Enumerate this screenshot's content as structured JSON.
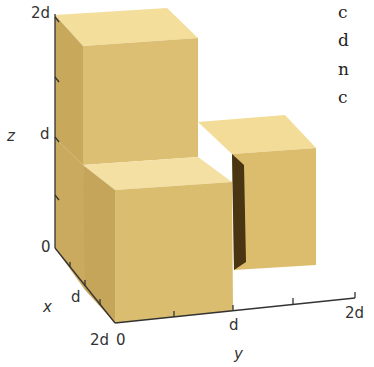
{
  "figure": {
    "colors": {
      "top_face": "#f3dd99",
      "front_face": "#dcbf72",
      "side_face": "#c8a95c",
      "shadow": "#4a3512",
      "axis": "#333333",
      "background": "#ffffff"
    },
    "axes": {
      "z": {
        "name": "z",
        "ticks": [
          "0",
          "d",
          "2d"
        ]
      },
      "x": {
        "name": "x",
        "ticks": [
          "0",
          "d",
          "2d"
        ]
      },
      "y": {
        "name": "y",
        "ticks": [
          "0",
          "d",
          "2d"
        ]
      }
    },
    "tick_labels": {
      "z_2d": "2d",
      "z_d": "d",
      "z_0": "0",
      "x_d": "d",
      "x_2d": "2d",
      "y_0": "0",
      "y_d": "d",
      "y_2d": "2d"
    },
    "cubes": [
      {
        "name": "upper-cube",
        "x": "0..d",
        "y": "0..d",
        "z": "d..2d"
      },
      {
        "name": "lower-front-cube",
        "x": "d..2d",
        "y": "0..d",
        "z": "0..d"
      },
      {
        "name": "right-cube",
        "x": "0..d",
        "y": "d..2d",
        "z": "0..d"
      }
    ],
    "cropped_side_text": [
      "c",
      "d",
      "n",
      "c"
    ]
  }
}
